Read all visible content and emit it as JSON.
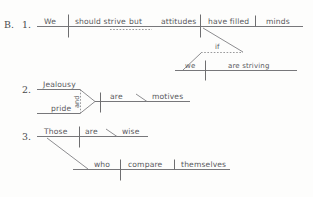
{
  "exercise": {
    "section_label": "B.",
    "background_color": "#fdfdfc",
    "ink_color": "#6e6e70"
  },
  "diagrams": [
    {
      "number": "1.",
      "sentence": "We should strive but attitudes have filled minds",
      "clauses": [
        {
          "name": "independent-clause-1",
          "subject": "We",
          "predicate": "should strive"
        },
        {
          "name": "independent-clause-2",
          "subject": "attitudes",
          "predicate": "have filled",
          "object": "minds"
        }
      ],
      "conjunction": "but",
      "subordinate": {
        "conjunction": "if",
        "subject": "we",
        "predicate": "are striving"
      }
    },
    {
      "number": "2.",
      "sentence": "Jealousy and pride are motives",
      "compound_subject": [
        "Jealousy",
        "pride"
      ],
      "conjunction": "and",
      "predicate": "are",
      "complement": "motives"
    },
    {
      "number": "3.",
      "sentence": "Those who compare themselves are wise",
      "subject": "Those",
      "predicate": "are",
      "complement": "wise",
      "relative_clause": {
        "subject": "who",
        "predicate": "compare",
        "object": "themselves"
      }
    }
  ]
}
